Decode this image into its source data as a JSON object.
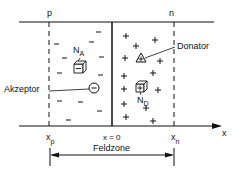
{
  "diagram": {
    "regions": {
      "p_label": "p",
      "n_label": "n"
    },
    "annotations": {
      "acceptor_label": "Akzeptor",
      "donor_label": "Donator",
      "na_main": "N",
      "na_sub": "A",
      "nd_main": "N",
      "nd_sub": "D"
    },
    "axis": {
      "axis_label": "x",
      "xp_main": "x",
      "xp_sub": "p",
      "x0": "x = 0",
      "xn_main": "x",
      "xn_sub": "n"
    },
    "zone": {
      "label": "Feldzone"
    },
    "charges": {
      "negative": "−",
      "positive": "+"
    }
  }
}
